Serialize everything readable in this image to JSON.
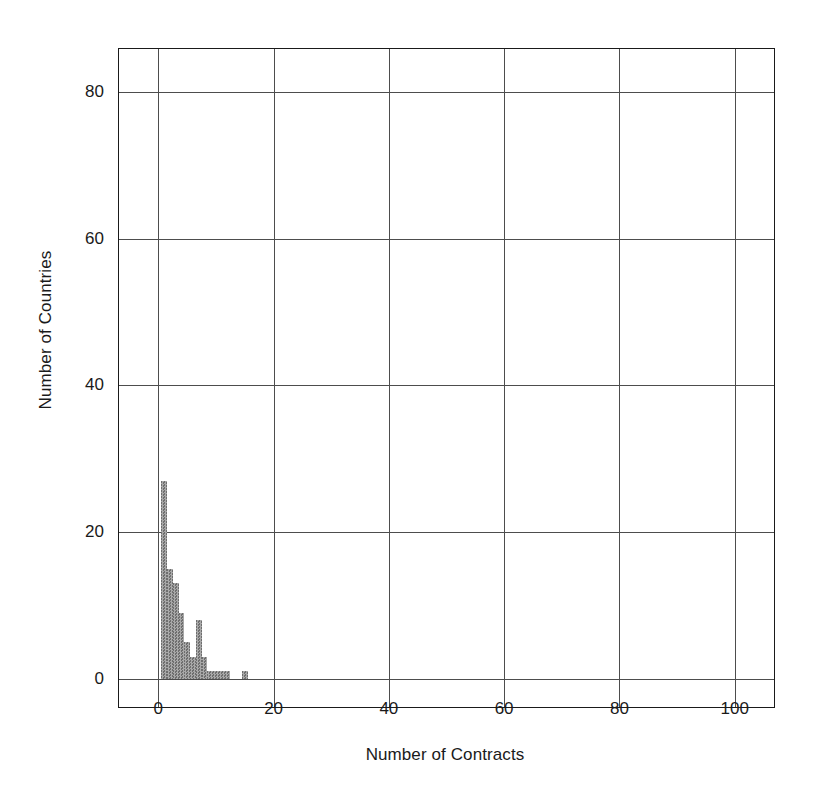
{
  "chart_data": {
    "type": "bar",
    "title": "",
    "subtitle": "",
    "xlabel": "Number of Contracts",
    "ylabel": "Number of Countries",
    "xlim": [
      -7,
      107
    ],
    "ylim": [
      -4,
      86
    ],
    "xticks": [
      0,
      20,
      40,
      60,
      80,
      100
    ],
    "yticks": [
      0,
      20,
      40,
      60,
      80
    ],
    "grid": true,
    "legend": null,
    "bin_width": 1,
    "categories": [
      1,
      2,
      3,
      4,
      5,
      6,
      7,
      8,
      9,
      10,
      11,
      12,
      13,
      14,
      15,
      16
    ],
    "values": [
      27,
      15,
      13,
      9,
      5,
      3,
      8,
      3,
      1,
      1,
      1,
      1,
      0,
      0,
      1,
      0
    ],
    "annotations": []
  },
  "axes": {
    "y_title": "Number of Countries",
    "x_title": "Number of Contracts",
    "y_tick_labels": [
      "0",
      "20",
      "40",
      "60",
      "80"
    ],
    "x_tick_labels": [
      "0",
      "20",
      "40",
      "60",
      "80",
      "100"
    ]
  },
  "colors": {
    "bar_fill": "#8c8c8c",
    "bar_fill_light": "#a8a8a8",
    "bar_fill_dark": "#6e6e6e",
    "frame": "#1a1a1a",
    "grid": "#4d4d4d",
    "background": "#ffffff",
    "text": "#1a1a1a"
  }
}
